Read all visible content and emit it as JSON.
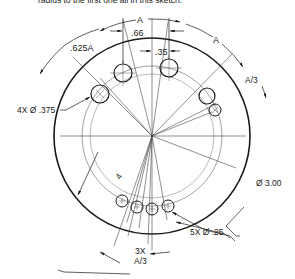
{
  "caption": "radius to the first one all in this sketch.",
  "drawing": {
    "part": "circular plate with hole pattern",
    "dimensions": {
      "arc_A_top": "A",
      "arc_A_right": "A",
      "arc_625A": ".625A",
      "linear_66": ".66",
      "linear_35": ".35",
      "arc_A3_right": "A/3",
      "radius_4": "4",
      "bottom_count": "3X",
      "bottom_arc": "A/3"
    },
    "callouts": {
      "large_holes": "4X Ø .375",
      "outer_diameter": "Ø 3.00",
      "small_holes": "5X Ø .25"
    },
    "colors": {
      "line": "#1a1a1a",
      "thin": "#555555",
      "construction": "#8a8a8a"
    }
  }
}
